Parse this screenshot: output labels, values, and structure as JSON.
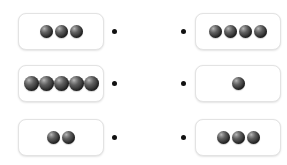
{
  "page": {
    "background_color": "#ffffff",
    "exercise_type": "matching-counting"
  },
  "style": {
    "ball_color": "#2e2e2e",
    "ball_highlight_color": "#b9b9b9",
    "box_border_color": "#e3e3e3",
    "box_fill_color": "#ffffff",
    "connector_dot_color": "#111111"
  },
  "icons": {
    "ball": "sphere-icon",
    "connector": "connector-dot-icon"
  },
  "rows": [
    {
      "row_index": 1,
      "left": {
        "ball_count": 3
      },
      "right": {
        "ball_count": 4
      }
    },
    {
      "row_index": 2,
      "left": {
        "ball_count": 5
      },
      "right": {
        "ball_count": 1
      }
    },
    {
      "row_index": 3,
      "left": {
        "ball_count": 2
      },
      "right": {
        "ball_count": 3
      }
    }
  ],
  "columns": {
    "left_counts": [
      3,
      5,
      2
    ],
    "right_counts": [
      4,
      1,
      3
    ]
  }
}
